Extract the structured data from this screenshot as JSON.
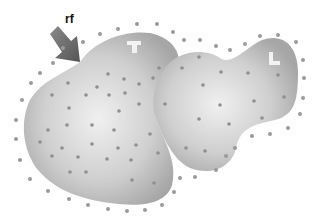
{
  "diagram": {
    "arrow_label": "rf",
    "regions": [
      {
        "id": "left-region",
        "letter": "T"
      },
      {
        "id": "right-region",
        "letter": "L"
      }
    ],
    "colors": {
      "region_center": "#ebebeb",
      "region_edge": "#a9a9a9",
      "dot": "#8f8f8f",
      "arrow": "#6e6e6e",
      "letter": "#f2f2f2"
    }
  }
}
